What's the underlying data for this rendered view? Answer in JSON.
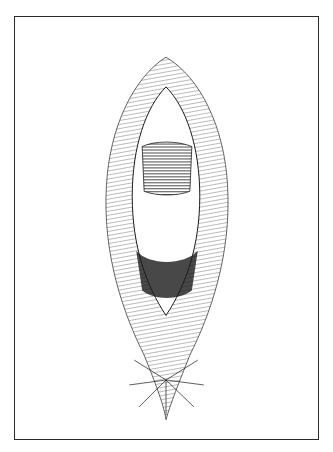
{
  "figure": {
    "description": "Monochrome pen-and-ink clinical anatomical illustration inside a thin rectangular border; no labels or text.",
    "style": "line-art hatching",
    "colors": {
      "ink": "#1a1a1a",
      "paper": "#ffffff",
      "border": "#2a2a2a"
    }
  }
}
